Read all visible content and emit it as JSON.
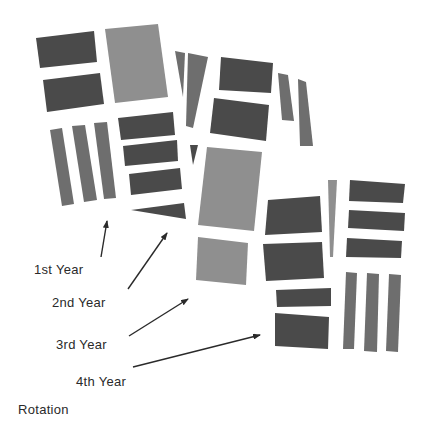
{
  "colors": {
    "dark": "#4a4a4a",
    "medium": "#6e6e6e",
    "light": "#8f8f8f",
    "arrow": "#2a2a2a",
    "background": "#ffffff"
  },
  "labels": {
    "year1": "1st Year",
    "year2": "2nd Year",
    "year3": "3rd Year",
    "year4": "4th Year",
    "caption": "Rotation"
  },
  "blocks": [
    {
      "name": "block-1st-year",
      "tiles": [
        {
          "pts": "36,38 94,31 97,62 40,68",
          "tone": "dark"
        },
        {
          "pts": "43,80 100,73 104,104 47,112",
          "tone": "dark"
        },
        {
          "pts": "105,29 158,24 168,97 115,103",
          "tone": "light"
        },
        {
          "pts": "50,130 62,128 74,204 62,206",
          "tone": "medium"
        },
        {
          "pts": "72,126 85,125 97,200 84,202",
          "tone": "medium"
        },
        {
          "pts": "94,123 107,122 116,198 104,199",
          "tone": "medium"
        },
        {
          "pts": "118,118 173,112 175,135 121,140",
          "tone": "dark"
        },
        {
          "pts": "123,146 177,140 178,161 125,166",
          "tone": "dark"
        },
        {
          "pts": "129,174 180,168 182,189 131,195",
          "tone": "dark"
        },
        {
          "pts": "131,210 184,203 186,219",
          "tone": "dark"
        }
      ]
    },
    {
      "name": "block-2nd-year",
      "tiles": [
        {
          "pts": "175,51 185,53 183,97",
          "tone": "medium"
        },
        {
          "pts": "188,53 208,57 193,128 186,126",
          "tone": "medium"
        },
        {
          "pts": "221,57 273,63 271,93 219,90",
          "tone": "dark"
        },
        {
          "pts": "214,98 269,105 266,141 210,133",
          "tone": "dark"
        },
        {
          "pts": "190,145 198,145 193,165",
          "tone": "dark"
        },
        {
          "pts": "207,147 262,152 254,231 198,225",
          "tone": "light"
        },
        {
          "pts": "198,237 248,243 246,285 196,280",
          "tone": "light"
        },
        {
          "pts": "278,73 288,75 294,121 282,120",
          "tone": "medium"
        },
        {
          "pts": "298,79 306,82 313,146 300,146",
          "tone": "medium"
        }
      ]
    },
    {
      "name": "block-3rd-year",
      "tiles": [
        {
          "pts": "268,200 320,196 322,232 265,235",
          "tone": "dark"
        },
        {
          "pts": "263,244 322,242 324,278 266,281",
          "tone": "dark"
        },
        {
          "pts": "328,180 337,180 333,257 330,257",
          "tone": "light"
        },
        {
          "pts": "350,180 405,184 403,203 349,201",
          "tone": "dark"
        },
        {
          "pts": "349,210 405,213 404,231 348,228",
          "tone": "dark"
        },
        {
          "pts": "347,238 402,241 401,258 346,257",
          "tone": "dark"
        },
        {
          "pts": "276,290 331,288 331,306 277,307",
          "tone": "dark"
        },
        {
          "pts": "275,313 329,317 328,349 275,346",
          "tone": "dark"
        }
      ]
    },
    {
      "name": "block-4th-year",
      "tiles": [
        {
          "pts": "346,272 357,273 354,349 343,349",
          "tone": "medium"
        },
        {
          "pts": "367,273 379,274 377,352 364,351",
          "tone": "medium"
        },
        {
          "pts": "389,274 401,275 398,352 386,351",
          "tone": "medium"
        }
      ]
    }
  ],
  "arrows": [
    {
      "name": "arrow-1st-year",
      "x1": 101,
      "y1": 257,
      "x2": 107,
      "y2": 221
    },
    {
      "name": "arrow-2nd-year",
      "x1": 128,
      "y1": 289,
      "x2": 167,
      "y2": 233
    },
    {
      "name": "arrow-3rd-year",
      "x1": 129,
      "y1": 336,
      "x2": 188,
      "y2": 299
    },
    {
      "name": "arrow-4th-year",
      "x1": 133,
      "y1": 367,
      "x2": 260,
      "y2": 335
    }
  ],
  "label_positions": {
    "year1": {
      "x": 34,
      "y": 262
    },
    "year2": {
      "x": 52,
      "y": 295
    },
    "year3": {
      "x": 56,
      "y": 337
    },
    "year4": {
      "x": 76,
      "y": 374
    },
    "caption": {
      "x": 18,
      "y": 402
    }
  }
}
